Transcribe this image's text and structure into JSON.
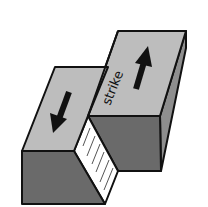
{
  "diagram": {
    "label_strike": "strike",
    "colors": {
      "top": "#bdbdbd",
      "front": "#6a6a6a",
      "side": "#8e8e8e",
      "fault_plane": "#ffffff",
      "outline": "#111111",
      "arrow": "#111111",
      "hatch": "#555555"
    },
    "arrows": [
      {
        "name": "left-block-motion",
        "direction": "down"
      },
      {
        "name": "right-block-motion",
        "direction": "up"
      }
    ]
  }
}
